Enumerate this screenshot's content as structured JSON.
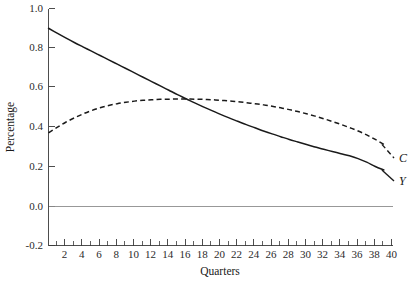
{
  "chart_data": {
    "type": "line",
    "title": "",
    "xlabel": "Quarters",
    "ylabel": "Percentage",
    "xlim": [
      1,
      41
    ],
    "ylim": [
      -0.2,
      1.0
    ],
    "grid": false,
    "legend_position": "right-inline-labels",
    "y_ticks": [
      "1.0",
      "0.8",
      "0.6",
      "0.4",
      "0.2",
      "0.0",
      "-0.2"
    ],
    "y_tick_values": [
      1.0,
      0.8,
      0.6,
      0.4,
      0.2,
      0.0,
      -0.2
    ],
    "x_ticks": [
      "2",
      "4",
      "6",
      "8",
      "10",
      "12",
      "14",
      "16",
      "18",
      "20",
      "22",
      "24",
      "26",
      "28",
      "30",
      "32",
      "34",
      "36",
      "38",
      "40"
    ],
    "x_tick_values": [
      2,
      4,
      6,
      8,
      10,
      12,
      14,
      16,
      18,
      20,
      22,
      24,
      26,
      28,
      30,
      32,
      34,
      36,
      38,
      40
    ],
    "x_minor_tick_values": [
      1,
      3,
      5,
      7,
      9,
      11,
      13,
      15,
      17,
      19,
      21,
      23,
      25,
      27,
      29,
      31,
      33,
      35,
      37,
      39,
      41
    ],
    "zero_reference_line": 0.0,
    "x": [
      1,
      2,
      3,
      4,
      5,
      6,
      7,
      8,
      9,
      10,
      11,
      12,
      13,
      14,
      15,
      16,
      17,
      18,
      19,
      20,
      21,
      22,
      23,
      24,
      25,
      26,
      27,
      28,
      29,
      30,
      31,
      32,
      33,
      34,
      35,
      36,
      37,
      38,
      39,
      40
    ],
    "series": [
      {
        "name": "Y",
        "label": "Y",
        "style": "solid",
        "color": "#1a1a1a",
        "values": [
          0.9,
          0.875,
          0.851,
          0.828,
          0.806,
          0.784,
          0.762,
          0.74,
          0.718,
          0.696,
          0.674,
          0.652,
          0.63,
          0.608,
          0.586,
          0.564,
          0.543,
          0.522,
          0.502,
          0.483,
          0.464,
          0.446,
          0.429,
          0.412,
          0.396,
          0.38,
          0.365,
          0.351,
          0.337,
          0.324,
          0.311,
          0.299,
          0.287,
          0.276,
          0.265,
          0.254,
          0.24,
          0.222,
          0.2,
          0.182
        ]
      },
      {
        "name": "C",
        "label": "C",
        "style": "dashed",
        "color": "#1a1a1a",
        "values": [
          0.37,
          0.398,
          0.424,
          0.446,
          0.466,
          0.483,
          0.497,
          0.509,
          0.518,
          0.525,
          0.531,
          0.535,
          0.538,
          0.54,
          0.541,
          0.542,
          0.542,
          0.541,
          0.54,
          0.538,
          0.535,
          0.532,
          0.528,
          0.523,
          0.518,
          0.512,
          0.505,
          0.497,
          0.488,
          0.478,
          0.467,
          0.455,
          0.442,
          0.428,
          0.413,
          0.397,
          0.38,
          0.36,
          0.337,
          0.312
        ]
      }
    ],
    "annotations": [
      {
        "text": "C",
        "series": "C",
        "x": 40,
        "y": 0.312
      },
      {
        "text": "Y",
        "series": "Y",
        "x": 40,
        "y": 0.182
      }
    ]
  }
}
